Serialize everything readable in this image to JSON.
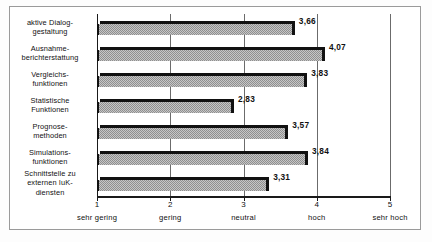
{
  "chart_data": {
    "type": "bar",
    "orientation": "horizontal",
    "title": "",
    "subtitle": "",
    "xlabel": "",
    "ylabel": "",
    "xlim": [
      1,
      5
    ],
    "grid": true,
    "legend": null,
    "categories": [
      "aktive Dialog-\ngestaltung",
      "Ausnahme-\nberichterstattung",
      "Vergleichs-\nfunktionen",
      "Statistische\nFunktionen",
      "Prognose-\nmethoden",
      "Simulations-\nfunktionen",
      "Schnittstelle zu\nexternen IuK-\ndiensten"
    ],
    "values": [
      3.66,
      4.07,
      3.83,
      2.83,
      3.57,
      3.84,
      3.31
    ],
    "value_labels": [
      "3,66",
      "4,07",
      "3,83",
      "2,83",
      "3,57",
      "3,84",
      "3,31"
    ],
    "xticks": [
      1,
      2,
      3,
      4,
      5
    ],
    "xtick_labels": [
      "1",
      "2",
      "3",
      "4",
      "5"
    ],
    "xtick_words": [
      "sehr gering",
      "gering",
      "neutral",
      "hoch",
      "sehr hoch"
    ],
    "colors": {
      "bar_fill": "#a8a8a8",
      "bar_edge": "#111111",
      "gridline": "#6b6b6b",
      "axis": "#1a1a1a",
      "frame": "#9a9a9a",
      "background": "#ffffff",
      "text": "#111111"
    }
  },
  "rows": [
    {
      "label_lines": [
        "aktive Dialog-",
        "gestaltung"
      ],
      "value": 3.66,
      "value_label": "3,66"
    },
    {
      "label_lines": [
        "Ausnahme-",
        "berichterstattung"
      ],
      "value": 4.07,
      "value_label": "4,07"
    },
    {
      "label_lines": [
        "Vergleichs-",
        "funktionen"
      ],
      "value": 3.83,
      "value_label": "3,83"
    },
    {
      "label_lines": [
        "Statistische",
        "Funktionen"
      ],
      "value": 2.83,
      "value_label": "2,83"
    },
    {
      "label_lines": [
        "Prognose-",
        "methoden"
      ],
      "value": 3.57,
      "value_label": "3,57"
    },
    {
      "label_lines": [
        "Simulations-",
        "funktionen"
      ],
      "value": 3.84,
      "value_label": "3,84"
    },
    {
      "label_lines": [
        "Schnittstelle zu",
        "externen IuK-",
        "diensten"
      ],
      "value": 3.31,
      "value_label": "3,31"
    }
  ],
  "axis": {
    "ticks": [
      {
        "value": 1,
        "num": "1",
        "word": "sehr gering"
      },
      {
        "value": 2,
        "num": "2",
        "word": "gering"
      },
      {
        "value": 3,
        "num": "3",
        "word": "neutral"
      },
      {
        "value": 4,
        "num": "4",
        "word": "hoch"
      },
      {
        "value": 5,
        "num": "5",
        "word": "sehr hoch"
      }
    ]
  }
}
